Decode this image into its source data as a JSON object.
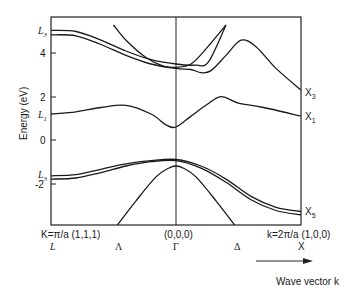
{
  "chart_data": {
    "type": "line",
    "title": "",
    "xlabel": "Wave vector k",
    "ylabel": "Energy (eV)",
    "ylim": [
      -4.0,
      5.3
    ],
    "yticks": [
      4,
      2,
      0,
      -2
    ],
    "grid": false,
    "legend": null,
    "x_points": [
      {
        "label": "L",
        "coord": "K=π/a (1,1,1)",
        "x": 0.0
      },
      {
        "label": "Λ",
        "coord": "",
        "x": 0.25
      },
      {
        "label": "Γ",
        "coord": "(0,0,0)",
        "x": 0.5
      },
      {
        "label": "Δ",
        "coord": "",
        "x": 0.75
      },
      {
        "label": "X",
        "coord": "k=2π/a (1,0,0)",
        "x": 1.0
      }
    ],
    "left_labels": [
      {
        "text": "L",
        "sub": "3",
        "energy": 5.0
      },
      {
        "text": "L",
        "sub": "1",
        "energy": 1.2
      },
      {
        "text": "L",
        "sub": "3",
        "energy": -1.7
      }
    ],
    "right_labels": [
      {
        "text": "X",
        "sub": "3",
        "energy": 2.3
      },
      {
        "text": "X",
        "sub": "1",
        "energy": 1.1
      },
      {
        "text": "X",
        "sub": "5",
        "energy": -3.3
      }
    ],
    "series": [
      {
        "name": "conduction-upper-1",
        "points": [
          [
            0,
            5.05
          ],
          [
            0.1,
            5.0
          ],
          [
            0.2,
            4.6
          ],
          [
            0.3,
            4.1
          ],
          [
            0.4,
            3.7
          ],
          [
            0.5,
            3.5
          ],
          [
            0.58,
            3.45
          ],
          [
            0.63,
            3.6
          ],
          [
            0.7,
            5.3
          ]
        ]
      },
      {
        "name": "conduction-upper-2",
        "points": [
          [
            0,
            4.85
          ],
          [
            0.1,
            4.8
          ],
          [
            0.2,
            4.4
          ],
          [
            0.3,
            3.9
          ],
          [
            0.4,
            3.5
          ],
          [
            0.5,
            3.3
          ],
          [
            0.56,
            3.25
          ],
          [
            0.6,
            3.1
          ],
          [
            0.64,
            3.2
          ],
          [
            0.7,
            3.9
          ],
          [
            0.76,
            4.6
          ],
          [
            0.82,
            4.3
          ],
          [
            0.9,
            3.3
          ],
          [
            1.0,
            2.3
          ]
        ]
      },
      {
        "name": "conduction-parabola",
        "points": [
          [
            0.25,
            5.3
          ],
          [
            0.3,
            4.6
          ],
          [
            0.38,
            3.8
          ],
          [
            0.45,
            3.4
          ],
          [
            0.5,
            3.35
          ],
          [
            0.56,
            3.5
          ],
          [
            0.62,
            4.2
          ],
          [
            0.7,
            5.3
          ]
        ]
      },
      {
        "name": "lowest-conduction",
        "points": [
          [
            0,
            1.2
          ],
          [
            0.1,
            1.3
          ],
          [
            0.2,
            1.5
          ],
          [
            0.3,
            1.6
          ],
          [
            0.4,
            1.2
          ],
          [
            0.46,
            0.7
          ],
          [
            0.5,
            0.6
          ],
          [
            0.56,
            1.1
          ],
          [
            0.62,
            1.6
          ],
          [
            0.68,
            2.0
          ],
          [
            0.75,
            1.7
          ],
          [
            0.85,
            1.5
          ],
          [
            1.0,
            1.1
          ]
        ]
      },
      {
        "name": "valence-upper",
        "points": [
          [
            0,
            -1.65
          ],
          [
            0.1,
            -1.6
          ],
          [
            0.2,
            -1.35
          ],
          [
            0.3,
            -1.1
          ],
          [
            0.4,
            -0.95
          ],
          [
            0.5,
            -0.9
          ],
          [
            0.6,
            -1.2
          ],
          [
            0.7,
            -1.8
          ],
          [
            0.8,
            -2.6
          ],
          [
            0.9,
            -3.1
          ],
          [
            1.0,
            -3.3
          ]
        ]
      },
      {
        "name": "valence-lower",
        "points": [
          [
            0,
            -1.8
          ],
          [
            0.1,
            -1.75
          ],
          [
            0.2,
            -1.5
          ],
          [
            0.3,
            -1.2
          ],
          [
            0.4,
            -1.0
          ],
          [
            0.5,
            -0.95
          ],
          [
            0.6,
            -1.3
          ],
          [
            0.7,
            -1.95
          ],
          [
            0.8,
            -2.75
          ],
          [
            0.9,
            -3.25
          ],
          [
            1.0,
            -3.45
          ]
        ]
      },
      {
        "name": "light-hole",
        "points": [
          [
            0.26,
            -4.0
          ],
          [
            0.34,
            -2.8
          ],
          [
            0.42,
            -1.7
          ],
          [
            0.47,
            -1.3
          ],
          [
            0.5,
            -1.2
          ],
          [
            0.53,
            -1.3
          ],
          [
            0.58,
            -1.7
          ],
          [
            0.66,
            -2.8
          ],
          [
            0.74,
            -4.0
          ]
        ]
      }
    ]
  },
  "labels": {
    "ylabel": "Energy (eV)",
    "xlabel": "Wave vector k",
    "left_coord": "K=π/a (1,1,1)",
    "gamma_coord": "(0,0,0)",
    "right_coord": "k=2π/a (1,0,0)",
    "L": "L",
    "Lambda": "Λ",
    "Gamma": "Γ",
    "Delta": "Δ",
    "X": "X",
    "tick_4": "4",
    "tick_2": "2",
    "tick_0": "0",
    "tick_m2": "-2",
    "L3_top": "L",
    "L3_top_sub": "3",
    "L1": "L",
    "L1_sub": "1",
    "L3_bottom": "L",
    "L3_bottom_sub": "3",
    "X3": "X",
    "X3_sub": "3",
    "X1": "X",
    "X1_sub": "1",
    "X5": "X",
    "X5_sub": "5"
  }
}
